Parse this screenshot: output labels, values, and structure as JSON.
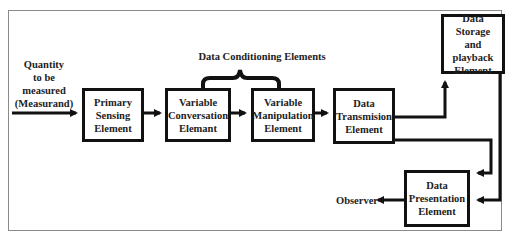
{
  "diagram": {
    "input_label": "Quantity\nto be\nmeasured\n(Measurand)",
    "group_label": "Data Conditioning Elements",
    "output_label": "Observer",
    "boxes": {
      "primary_sensing": "Primary\nSensing\nElement",
      "variable_conversion": "Variable\nConversation\nElemant",
      "variable_manipulation": "Variable\nManipulation\nElement",
      "data_transmission": "Data\nTransmision\nElement",
      "data_storage": "Data Storage\nand playback\nElement",
      "data_presentation": "Data\nPresentation\nElement"
    },
    "colors": {
      "stroke": "#111111",
      "frame": "#8a8a8a",
      "text": "#222222"
    }
  }
}
